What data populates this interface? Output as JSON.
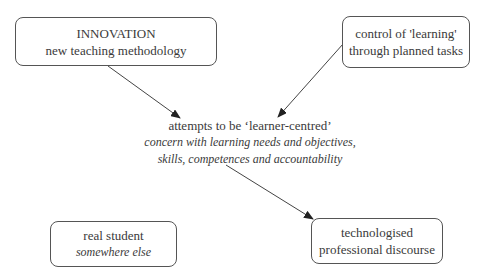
{
  "nodes": {
    "innovation": {
      "title": "INNOVATION",
      "subtitle": "new teaching methodology"
    },
    "control": {
      "line1": "control of 'learning'",
      "line2": "through planned tasks"
    },
    "center": {
      "title": "attempts to be ‘learner-centred’",
      "line2": "concern with learning needs and objectives,",
      "line3": "skills, competences and accountability"
    },
    "student": {
      "title": "real student",
      "subtitle": "somewhere else"
    },
    "discourse": {
      "line1": "technologised",
      "line2": "professional discourse"
    }
  },
  "edges": [
    {
      "from": "innovation",
      "to": "center"
    },
    {
      "from": "control",
      "to": "center"
    },
    {
      "from": "center",
      "to": "discourse"
    }
  ],
  "colors": {
    "stroke": "#555555",
    "text": "#333333"
  }
}
